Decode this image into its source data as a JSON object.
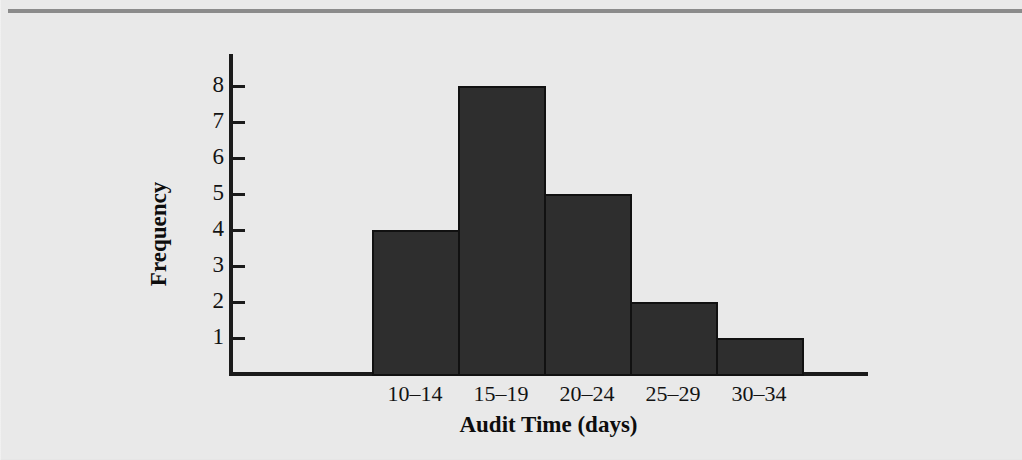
{
  "figure": {
    "background_color": "#e9e9e9",
    "rule_color": "#8b8b8b",
    "bar_fill_color": "#2e2e2e",
    "bar_edge_color": "#111111",
    "axis_color": "#1b1b1b"
  },
  "chart_data": {
    "type": "bar",
    "title": "",
    "xlabel": "Audit Time (days)",
    "ylabel": "Frequency",
    "categories": [
      "10–14",
      "15–19",
      "20–24",
      "25–29",
      "30–34"
    ],
    "values": [
      4,
      8,
      5,
      2,
      1
    ],
    "ylim": [
      0,
      8
    ],
    "yticks": [
      1,
      2,
      3,
      4,
      5,
      6,
      7,
      8
    ],
    "ytick_labels": [
      "1",
      "2",
      "3",
      "4",
      "5",
      "6",
      "7",
      "8"
    ],
    "grid": false,
    "legend": null,
    "bar_gap": 0
  }
}
